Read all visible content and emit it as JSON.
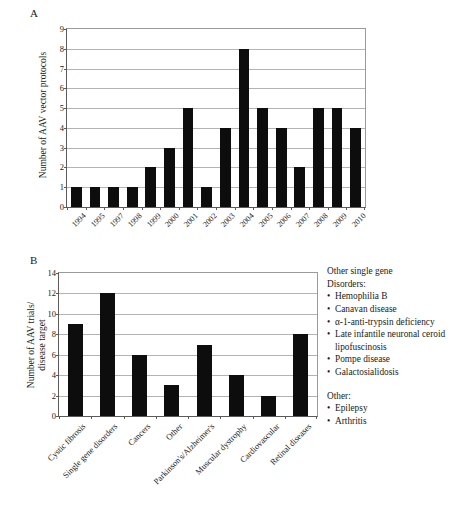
{
  "figure": {
    "panel_a_letter": "A",
    "panel_b_letter": "B"
  },
  "chart_data": [
    {
      "id": "panel-a",
      "type": "bar",
      "title": "",
      "panel_label": "A",
      "xlabel": "",
      "ylabel": "Number of AAV vector protocols",
      "ylim": [
        0,
        9
      ],
      "ytick_step": 1,
      "yticks": [
        "0",
        "1",
        "2",
        "3",
        "4",
        "5",
        "6",
        "7",
        "8",
        "9"
      ],
      "grid": true,
      "legend": "none",
      "categories": [
        "1994",
        "1995",
        "1997",
        "1998",
        "1999",
        "2000",
        "2001",
        "2002",
        "2003",
        "2004",
        "2005",
        "2006",
        "2007",
        "2008",
        "2009",
        "2010"
      ],
      "values": [
        1,
        1,
        1,
        1,
        2,
        3,
        5,
        1,
        4,
        8,
        5,
        4,
        2,
        5,
        5,
        4
      ],
      "bar_color": "#0d0d0d"
    },
    {
      "id": "panel-b",
      "type": "bar",
      "title": "",
      "panel_label": "B",
      "xlabel": "",
      "ylabel": "Number of AAV trials/ disease target",
      "ylabel_line1": "Number of AAV trials/",
      "ylabel_line2": "disease target",
      "ylim": [
        0,
        14
      ],
      "ytick_step": 2,
      "yticks": [
        "0",
        "2",
        "4",
        "6",
        "8",
        "10",
        "12",
        "14"
      ],
      "grid": true,
      "legend": "none",
      "categories": [
        "Cystic fibrosis",
        "Single gene disorders",
        "Cancers",
        "Other",
        "Parkinson's/Alzheimer's",
        "Muscular dystrophy",
        "Cardiovascular",
        "Retinal diseases"
      ],
      "values": [
        9,
        12,
        6,
        3,
        7,
        4,
        2,
        8
      ],
      "bar_color": "#0d0d0d"
    }
  ],
  "side_notes": {
    "single_gene": {
      "heading_line1": "Other single gene",
      "heading_line2": "Disorders:",
      "items": [
        "Hemophilia B",
        "Canavan disease",
        "α-1-anti-trypsin deficiency",
        "Late infantile neuronal ceroid lipofuscinosis",
        "Pompe disease",
        "Galactosialidosis"
      ]
    },
    "other": {
      "heading": "Other:",
      "items": [
        "Epilepsy",
        "Arthritis"
      ]
    }
  }
}
